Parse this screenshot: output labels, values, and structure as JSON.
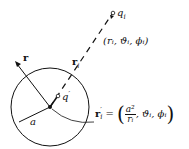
{
  "diagram": {
    "labels": {
      "r": "r",
      "ri": "r",
      "ri_sub": "i",
      "qi": "q",
      "qi_sub": "i",
      "qprime": "q",
      "qprime_sup": "′",
      "a": "a",
      "coords_i": "(rᵢ, ϑᵢ, ϕᵢ)",
      "ri_prime": "r",
      "ri_prime_sub": "i",
      "ri_prime_sup": "′",
      "ri_prime_eq": "=",
      "ri_prime_frac_num": "a²",
      "ri_prime_frac_den": "rᵢ",
      "ri_prime_rest": ", ϑᵢ, ϕᵢ"
    },
    "geometry": {
      "sphere_center": [
        50,
        107
      ],
      "sphere_radius": 39,
      "charge_qi": [
        112,
        14
      ],
      "image_charge": [
        58,
        96
      ]
    }
  }
}
